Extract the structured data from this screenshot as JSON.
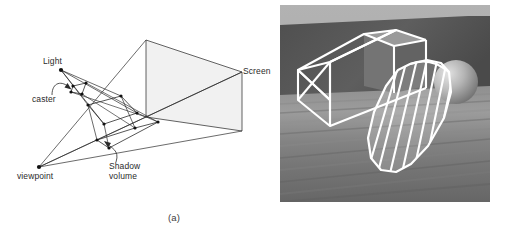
{
  "figure": {
    "background_color": "#ffffff",
    "width": 511,
    "height": 236,
    "captions": {
      "a": "(a)",
      "b": "(b)"
    }
  },
  "panel_a": {
    "type": "line-diagram",
    "description": "Shadow volume construction diagram: light source, shadow caster polygon, viewpoint, view frustum to screen, and the shadow volume polyhedron.",
    "stroke_color": "#2b2b2b",
    "screen_fill": "#f1f1f1",
    "labels": {
      "light": "Light",
      "caster": "caster",
      "screen": "Screen",
      "viewpoint": "viewpoint",
      "shadow_volume_line1": "Shadow",
      "shadow_volume_line2": "volume"
    },
    "points": {
      "light": [
        61,
        70
      ],
      "viewpoint": [
        39,
        167
      ],
      "caster": [
        [
          73,
          86
        ],
        [
          86,
          83
        ],
        [
          82,
          94
        ],
        [
          71,
          92
        ]
      ],
      "screen_quad": [
        [
          146,
          40
        ],
        [
          242,
          72
        ],
        [
          242,
          131
        ],
        [
          146,
          117
        ]
      ],
      "shadow_volume_top": [
        [
          88,
          105
        ],
        [
          121,
          96
        ],
        [
          137,
          113
        ],
        [
          104,
          124
        ]
      ],
      "shadow_volume_bottom": [
        [
          97,
          140
        ],
        [
          135,
          128
        ],
        [
          158,
          122
        ],
        [
          109,
          148
        ]
      ]
    }
  },
  "panel_b": {
    "type": "photograph",
    "description": "Rendered photo: wooden table surface with a dark wall behind, a white wireframe shadow-volume prism over a box object, a sphere at right, and a striped wireframe shadow volume cone in the foreground.",
    "frame": {
      "left": 280,
      "top": 5,
      "width": 210,
      "height": 197
    },
    "colors": {
      "wall_upper": "#a9a9a9",
      "wall_dark": "#565656",
      "table_light": "#9a9a9a",
      "table_mid": "#7d7d7d",
      "table_dark": "#626262",
      "wireframe": "#ffffff",
      "box_face_light": "#8d8d8d",
      "box_face_dark": "#6a6a6a",
      "sphere": "#bdbdbd"
    }
  }
}
